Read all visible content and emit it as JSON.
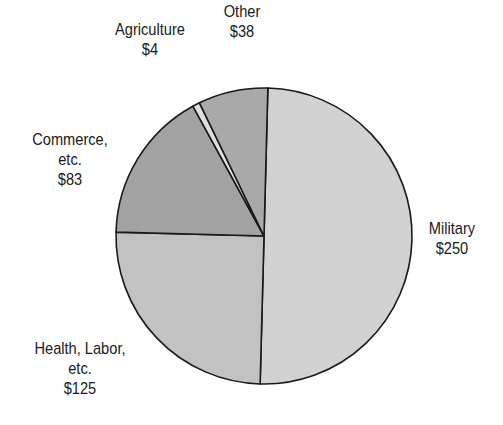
{
  "chart_data": {
    "type": "pie",
    "title": "",
    "units": "$",
    "start_angle_deg": 1.5,
    "direction": "clockwise",
    "total": 500,
    "slices": [
      {
        "label": "Military",
        "value": 250,
        "display": "$250",
        "color": "#d2d2d2"
      },
      {
        "label": "Health, Labor, etc.",
        "value": 125,
        "display": "$125",
        "color": "#c2c2c2"
      },
      {
        "label": "Commerce, etc.",
        "value": 83,
        "display": "$83",
        "color": "#a2a2a2"
      },
      {
        "label": "Agriculture",
        "value": 4,
        "display": "$4",
        "color": "#dedede"
      },
      {
        "label": "Other",
        "value": 38,
        "display": "$38",
        "color": "#a9a9a9"
      }
    ],
    "legend": "none (direct labels)"
  },
  "labels": {
    "military": {
      "line1": "Military",
      "value": "$250"
    },
    "health": {
      "line1": "Health, Labor,",
      "line2": "etc.",
      "value": "$125"
    },
    "commerce": {
      "line1": "Commerce,",
      "line2": "etc.",
      "value": "$83"
    },
    "agriculture": {
      "line1": "Agriculture",
      "value": "$4"
    },
    "other": {
      "line1": "Other",
      "value": "$38"
    }
  },
  "geometry": {
    "cx": 264,
    "cy": 236,
    "r": 148,
    "stroke": "#1a1a1a"
  }
}
